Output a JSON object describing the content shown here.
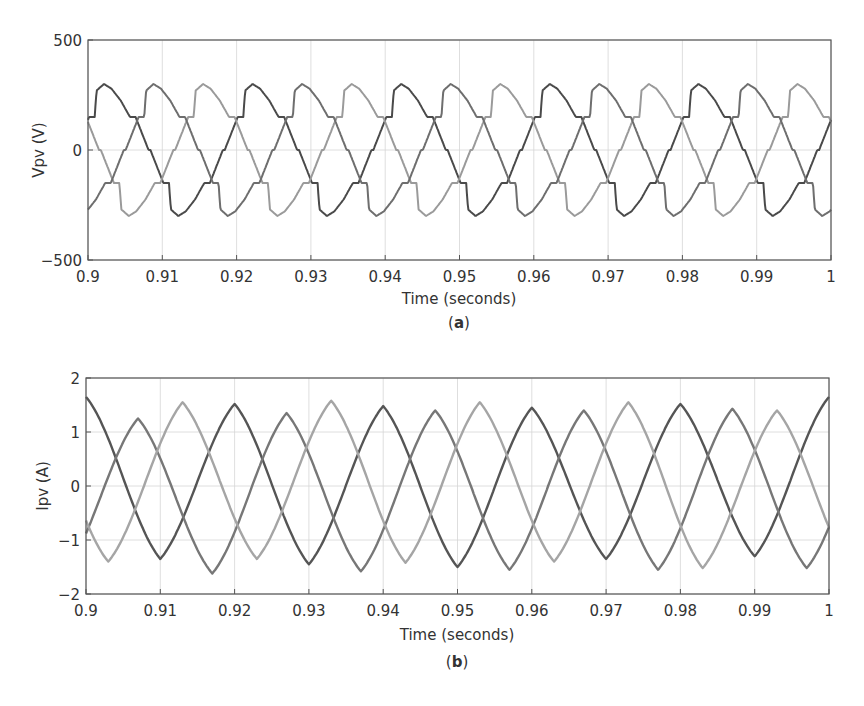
{
  "figure": {
    "panels": [
      {
        "id": "a",
        "caption_letter": "a",
        "ylabel": "Vpv (V)",
        "xlabel": "Time (seconds)",
        "yticks": [
          "500",
          "0",
          "−500"
        ],
        "xticks": [
          "0.9",
          "0.91",
          "0.92",
          "0.93",
          "0.94",
          "0.95",
          "0.96",
          "0.97",
          "0.98",
          "0.99",
          "1"
        ]
      },
      {
        "id": "b",
        "caption_letter": "b",
        "ylabel": "Ipv (A)",
        "xlabel": "Time (seconds)",
        "yticks": [
          "2",
          "1",
          "0",
          "−1",
          "−2"
        ],
        "xticks": [
          "0.9",
          "0.91",
          "0.92",
          "0.93",
          "0.94",
          "0.95",
          "0.96",
          "0.97",
          "0.98",
          "0.99",
          "1"
        ]
      }
    ]
  },
  "chart_data": [
    {
      "type": "line",
      "title": "(a)",
      "xlabel": "Time (seconds)",
      "ylabel": "Vpv (V)",
      "xlim": [
        0.9,
        1.0
      ],
      "ylim": [
        -500,
        500
      ],
      "xticks": [
        0.9,
        0.91,
        0.92,
        0.93,
        0.94,
        0.95,
        0.96,
        0.97,
        0.98,
        0.99,
        1.0
      ],
      "yticks": [
        -500,
        0,
        500
      ],
      "grid": true,
      "legend": null,
      "description": "Three-phase six-step-like PV voltage waveform, fundamental period ~0.02 s, peaks ~ +/-300 V, knees ~ +/-150 V",
      "waveform": {
        "period": 0.02,
        "peak": 300,
        "knee": 150,
        "phase0_offset": 0.9
      },
      "series": [
        {
          "name": "Phase A",
          "color": "#4a4a4a",
          "phase_deg": 0
        },
        {
          "name": "Phase B",
          "color": "#9a9a9a",
          "phase_deg": 120
        },
        {
          "name": "Phase C",
          "color": "#6e6e6e",
          "phase_deg": 240
        }
      ]
    },
    {
      "type": "line",
      "title": "(b)",
      "xlabel": "Time (seconds)",
      "ylabel": "Ipv (A)",
      "xlim": [
        0.9,
        1.0
      ],
      "ylim": [
        -2,
        2
      ],
      "xticks": [
        0.9,
        0.91,
        0.92,
        0.93,
        0.94,
        0.95,
        0.96,
        0.97,
        0.98,
        0.99,
        1.0
      ],
      "yticks": [
        -2,
        -1,
        0,
        1,
        2
      ],
      "grid": true,
      "legend": null,
      "description": "Three-phase near-sinusoidal PV current, period ~0.02 s, amplitude ~1.25-1.65 A",
      "series": [
        {
          "name": "Phase A",
          "color": "#555555",
          "peaks": [
            [
              0.9,
              1.65
            ],
            [
              0.92,
              1.52
            ],
            [
              0.94,
              1.48
            ],
            [
              0.96,
              1.45
            ],
            [
              0.98,
              1.52
            ],
            [
              1.0,
              1.65
            ]
          ],
          "troughs": [
            [
              0.91,
              -1.35
            ],
            [
              0.93,
              -1.45
            ],
            [
              0.95,
              -1.5
            ],
            [
              0.97,
              -1.35
            ],
            [
              0.99,
              -1.3
            ]
          ]
        },
        {
          "name": "Phase B",
          "color": "#777777",
          "peaks": [
            [
              0.907,
              1.25
            ],
            [
              0.927,
              1.35
            ],
            [
              0.947,
              1.4
            ],
            [
              0.967,
              1.4
            ],
            [
              0.987,
              1.43
            ]
          ],
          "troughs": [
            [
              0.917,
              -1.62
            ],
            [
              0.937,
              -1.58
            ],
            [
              0.957,
              -1.55
            ],
            [
              0.977,
              -1.55
            ],
            [
              0.997,
              -1.52
            ]
          ]
        },
        {
          "name": "Phase C",
          "color": "#a5a5a5",
          "peaks": [
            [
              0.913,
              1.55
            ],
            [
              0.933,
              1.58
            ],
            [
              0.953,
              1.55
            ],
            [
              0.973,
              1.55
            ],
            [
              0.993,
              1.4
            ]
          ],
          "troughs": [
            [
              0.903,
              -1.4
            ],
            [
              0.923,
              -1.35
            ],
            [
              0.943,
              -1.42
            ],
            [
              0.963,
              -1.4
            ],
            [
              0.983,
              -1.52
            ]
          ]
        }
      ]
    }
  ]
}
